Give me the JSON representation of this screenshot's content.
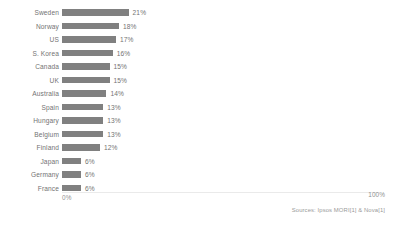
{
  "chart_data": {
    "type": "bar",
    "orientation": "horizontal",
    "title": "",
    "xlabel": "",
    "ylabel": "",
    "xlim": [
      0,
      100
    ],
    "grid": false,
    "legend": null,
    "bar_color": "#808080",
    "categories": [
      "Sweden",
      "Norway",
      "US",
      "S. Korea",
      "Canada",
      "UK",
      "Australia",
      "Spain",
      "Hungary",
      "Belgium",
      "Finland",
      "Japan",
      "Germany",
      "France"
    ],
    "values": [
      21,
      18,
      17,
      16,
      15,
      15,
      14,
      13,
      13,
      13,
      12,
      6,
      6,
      6
    ],
    "value_labels": [
      "21%",
      "18%",
      "17%",
      "16%",
      "15%",
      "15%",
      "14%",
      "13%",
      "13%",
      "13%",
      "12%",
      "6%",
      "6%",
      "6%"
    ],
    "axis_ticks": [
      "0%",
      "100%"
    ],
    "annotations": [
      "Sources: Ipsos MORI[1] & Nova[1]"
    ]
  },
  "axis": {
    "min_label": "0%",
    "max_label": "100%"
  },
  "footer": {
    "source": "Sources: Ipsos MORI[1] & Nova[1]"
  }
}
